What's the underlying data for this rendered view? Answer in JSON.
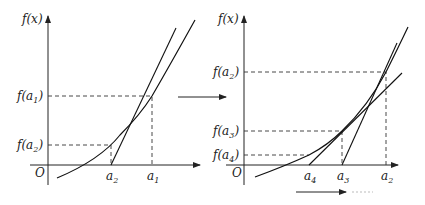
{
  "left_panel": {
    "y_axis_label": "f(x)",
    "origin_label": "O",
    "y_ticks": [
      {
        "base": "f(a",
        "sub": "1",
        "close": ")"
      },
      {
        "base": "f(a",
        "sub": "2",
        "close": ")"
      }
    ],
    "x_ticks": [
      {
        "base": "a",
        "sub": "2"
      },
      {
        "base": "a",
        "sub": "1"
      }
    ]
  },
  "right_panel": {
    "y_axis_label": "f(x)",
    "origin_label": "O",
    "y_ticks": [
      {
        "base": "f(a",
        "sub": "2",
        "close": ")"
      },
      {
        "base": "f(a",
        "sub": "3",
        "close": ")"
      },
      {
        "base": "f(a",
        "sub": "4",
        "close": ")"
      }
    ],
    "x_ticks": [
      {
        "base": "a",
        "sub": "4"
      },
      {
        "base": "a",
        "sub": "3"
      },
      {
        "base": "a",
        "sub": "2"
      }
    ]
  },
  "transition_arrow": "right-arrow",
  "continuation": {
    "arrow": "right-arrow",
    "ellipsis": "……"
  }
}
